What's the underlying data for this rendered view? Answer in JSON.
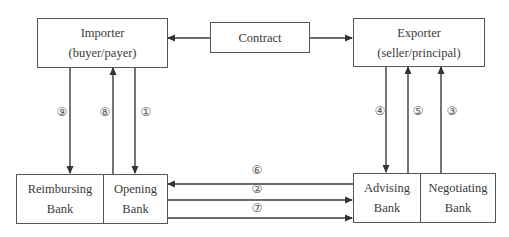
{
  "diagram": {
    "nodes": {
      "importer": {
        "line1": "Importer",
        "line2": "(buyer/payer)"
      },
      "contract": {
        "line1": "Contract"
      },
      "exporter": {
        "line1": "Exporter",
        "line2": "(seller/principal)"
      },
      "reimbursing_bank": {
        "line1": "Reimbursing",
        "line2": "Bank"
      },
      "opening_bank": {
        "line1": "Opening",
        "line2": "Bank"
      },
      "advising_bank": {
        "line1": "Advising",
        "line2": "Bank"
      },
      "negotiating_bank": {
        "line1": "Negotiating",
        "line2": "Bank"
      }
    },
    "edges": [
      {
        "id": "contract-importer",
        "from": "Contract",
        "to": "Importer",
        "label": ""
      },
      {
        "id": "contract-exporter",
        "from": "Contract",
        "to": "Exporter",
        "label": ""
      },
      {
        "id": "step1",
        "from": "Importer",
        "to": "Opening Bank",
        "label": "①"
      },
      {
        "id": "step2",
        "from": "Opening Bank",
        "to": "Advising Bank",
        "label": "②"
      },
      {
        "id": "step3",
        "from": "Negotiating Bank",
        "to": "Exporter",
        "label": "③"
      },
      {
        "id": "step4",
        "from": "Exporter",
        "to": "Advising Bank",
        "label": "④"
      },
      {
        "id": "step5",
        "from": "Advising Bank",
        "to": "Exporter",
        "label": "⑤"
      },
      {
        "id": "step6",
        "from": "Advising Bank",
        "to": "Opening Bank",
        "label": "⑥"
      },
      {
        "id": "step7",
        "from": "Opening Bank",
        "to": "Advising Bank",
        "label": "⑦"
      },
      {
        "id": "step8",
        "from": "Opening Bank",
        "to": "Importer",
        "label": "⑧"
      },
      {
        "id": "step9",
        "from": "Importer",
        "to": "Reimbursing Bank",
        "label": "⑨"
      }
    ],
    "colors": {
      "line": "#3a3a3a",
      "text": "#3a3a3a"
    }
  }
}
